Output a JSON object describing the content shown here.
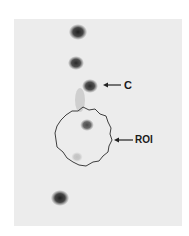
{
  "figure": {
    "background_color": "#ececec",
    "spot_color": "#1e1e1e",
    "labels": {
      "c": "C",
      "roi": "ROI"
    },
    "spots": [
      {
        "name": "spot-1",
        "cx": 78,
        "cy": 32,
        "r": 8,
        "opacity": 0.95
      },
      {
        "name": "spot-2",
        "cx": 76,
        "cy": 63,
        "r": 7,
        "opacity": 0.9
      },
      {
        "name": "spot-c",
        "cx": 90,
        "cy": 86,
        "r": 7,
        "opacity": 0.9
      },
      {
        "name": "spot-roi-upper",
        "cx": 87,
        "cy": 125,
        "r": 6,
        "opacity": 0.75
      },
      {
        "name": "spot-roi-faint",
        "cx": 77,
        "cy": 157,
        "r": 5,
        "opacity": 0.2
      },
      {
        "name": "spot-bottom",
        "cx": 60,
        "cy": 198,
        "r": 8,
        "opacity": 0.95
      }
    ],
    "roi": {
      "cx": 83,
      "cy": 137,
      "r": 28
    }
  }
}
